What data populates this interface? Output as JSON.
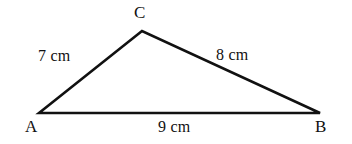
{
  "figure": {
    "type": "triangle-diagram",
    "background_color": "#ffffff",
    "stroke_color": "#111111",
    "stroke_width": 2.6,
    "vertices": {
      "a": {
        "label": "A",
        "x": 39,
        "y": 113
      },
      "b": {
        "label": "B",
        "x": 320,
        "y": 113
      },
      "c": {
        "label": "C",
        "x": 142,
        "y": 31
      }
    },
    "sides": {
      "ac": {
        "label": "7 cm",
        "length": 7,
        "unit": "cm",
        "from": "A",
        "to": "C"
      },
      "cb": {
        "label": "8 cm",
        "length": 8,
        "unit": "cm",
        "from": "C",
        "to": "B"
      },
      "ab": {
        "label": "9 cm",
        "length": 9,
        "unit": "cm",
        "from": "A",
        "to": "B"
      }
    }
  }
}
